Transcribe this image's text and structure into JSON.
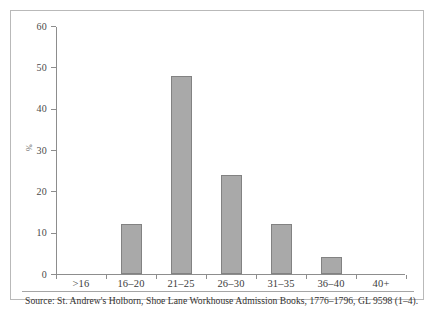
{
  "figure": {
    "source_caption": "Source: St. Andrew's Holborn, Shoe Lane Workhouse Admission Books, 1776–1796, GL 9598 (1–4).",
    "frame_color": "#b9b9b9"
  },
  "chart_data": {
    "type": "bar",
    "title": "",
    "subtitle": "",
    "xlabel": "",
    "ylabel": "%",
    "categories": [
      ">16",
      "16–20",
      "21–25",
      "26–30",
      "31–35",
      "36–40",
      "40+"
    ],
    "values": [
      0,
      12,
      48,
      24,
      12,
      4,
      0
    ],
    "ylim": [
      0,
      60
    ],
    "ytick_labels": [
      "0",
      "10",
      "20",
      "30",
      "40",
      "50",
      "60"
    ],
    "ytick_values": [
      0,
      10,
      20,
      30,
      40,
      50,
      60
    ],
    "grid": false,
    "legend": false,
    "legend_position": "none",
    "bar_fill_color": "#a9a9a9",
    "bar_edge_color": "#828282",
    "axis_color": "#8d8d8d"
  }
}
